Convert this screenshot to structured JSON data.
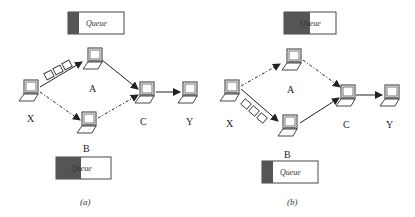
{
  "diagrams": [
    {
      "id": "a",
      "caption": "(a)",
      "nodes": [
        {
          "id": "X",
          "label": "X"
        },
        {
          "id": "A",
          "label": "A"
        },
        {
          "id": "B",
          "label": "B"
        },
        {
          "id": "C",
          "label": "C"
        },
        {
          "id": "Y",
          "label": "Y"
        }
      ],
      "edges": [
        {
          "from": "X",
          "to": "A",
          "style": "solid",
          "packets": 3
        },
        {
          "from": "A",
          "to": "C",
          "style": "solid"
        },
        {
          "from": "X",
          "to": "B",
          "style": "dashed"
        },
        {
          "from": "B",
          "to": "C",
          "style": "dashed"
        },
        {
          "from": "C",
          "to": "Y",
          "style": "solid"
        }
      ],
      "queues": [
        {
          "node": "A",
          "label": "Queue",
          "fill_fraction": 0.2
        },
        {
          "node": "B",
          "label": "Queue",
          "fill_fraction": 0.45
        }
      ]
    },
    {
      "id": "b",
      "caption": "(b)",
      "nodes": [
        {
          "id": "X",
          "label": "X"
        },
        {
          "id": "A",
          "label": "A"
        },
        {
          "id": "B",
          "label": "B"
        },
        {
          "id": "C",
          "label": "C"
        },
        {
          "id": "Y",
          "label": "Y"
        }
      ],
      "edges": [
        {
          "from": "X",
          "to": "A",
          "style": "dashed"
        },
        {
          "from": "A",
          "to": "C",
          "style": "dashed"
        },
        {
          "from": "X",
          "to": "B",
          "style": "solid",
          "packets": 3
        },
        {
          "from": "B",
          "to": "C",
          "style": "solid"
        },
        {
          "from": "C",
          "to": "Y",
          "style": "solid"
        }
      ],
      "queues": [
        {
          "node": "A",
          "label": "Queue",
          "fill_fraction": 0.45
        },
        {
          "node": "B",
          "label": "Queue",
          "fill_fraction": 0.2
        }
      ]
    }
  ],
  "colors": {
    "queue_fill": "#555555",
    "line": "#222222"
  }
}
